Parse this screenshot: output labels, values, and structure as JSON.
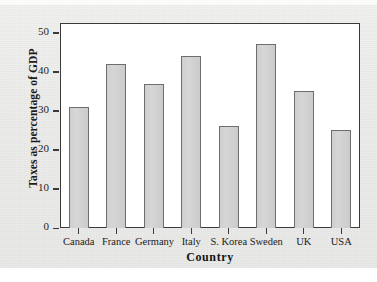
{
  "chart_data": {
    "type": "bar",
    "title": "",
    "xlabel": "Country",
    "ylabel": "Taxes as percentage of GDP",
    "categories": [
      "Canada",
      "France",
      "Germany",
      "Italy",
      "S. Korea",
      "Sweden",
      "UK",
      "USA"
    ],
    "values": [
      31,
      42,
      37,
      44,
      26,
      47,
      35,
      25
    ],
    "ylim": [
      0,
      52.5
    ],
    "yticks": [
      0,
      10,
      20,
      30,
      40,
      50
    ],
    "ytick_labels": [
      "0",
      "10",
      "20",
      "30",
      "40",
      "50"
    ],
    "grid": false,
    "legend": null,
    "bar_color": "#d2d2d2",
    "bar_edge_color": "#6e6e6e",
    "axis_color": "#3a3a3a",
    "plot_background": "#ffffff",
    "figure_background": "#ececea"
  }
}
